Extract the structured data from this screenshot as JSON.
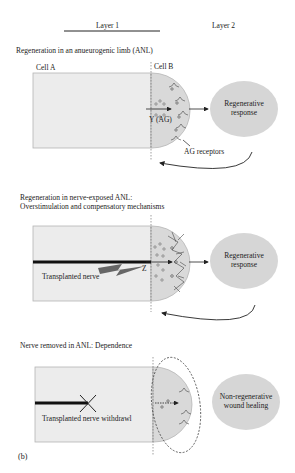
{
  "header": {
    "layer1_label": "Layer 1",
    "layer2_label": "Layer 2"
  },
  "panel1": {
    "title": "Regeneration in an anueurogenic limb (ANL)",
    "cell_a_label": "Cell A",
    "cell_b_label": "Cell B",
    "signal_label": "Y (AG)",
    "receptors_label": "AG receptors",
    "response_line1": "Regenerative",
    "response_line2": "response"
  },
  "panel2": {
    "title_line1": "Regeneration in nerve-exposed ANL:",
    "title_line2": "Overstimulation and compensatory mechanisms",
    "nerve_label": "Transplanted nerve",
    "signal_label": "Z",
    "response_line1": "Regenerative",
    "response_line2": "response"
  },
  "panel3": {
    "title": "Nerve removed in ANL: Dependence",
    "nerve_label": "Transplanted nerve withdrawl",
    "response_line1": "Non-regenerative",
    "response_line2": "wound healing"
  },
  "figure_label": "(b)",
  "colors": {
    "cell_fill": "#ececec",
    "cell_stroke": "#b5b5b5",
    "cap_fill": "#d9d9d9",
    "response_fill": "#d6d6d6",
    "line": "#222222"
  }
}
